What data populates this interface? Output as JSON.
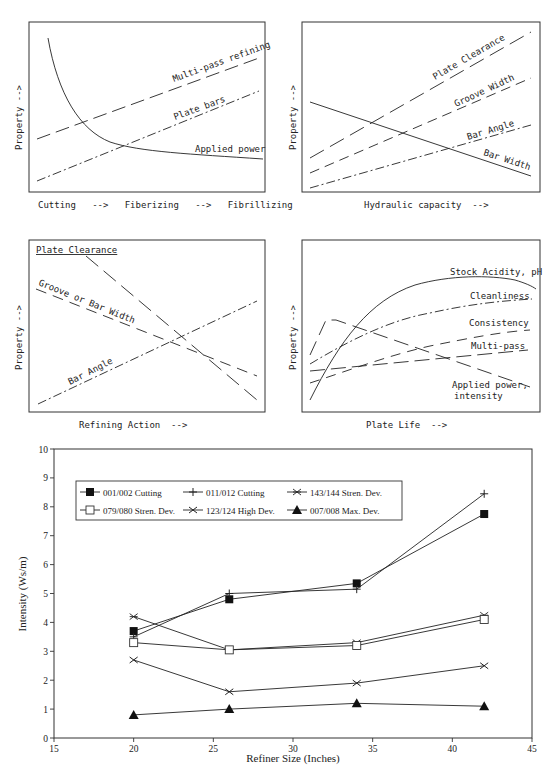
{
  "panels": [
    {
      "id": "tl",
      "ylabel": "Property  -->",
      "xlabel": "Cutting   -->   Fiberizing   -->   Fibrillizing",
      "curves": [
        {
          "label": "Multi-pass refining",
          "style": "long-dash"
        },
        {
          "label": "Plate bars",
          "style": "dash-dot"
        },
        {
          "label": "Applied power",
          "style": "solid"
        }
      ]
    },
    {
      "id": "tr",
      "ylabel": "Property  -->",
      "xlabel": "Hydraulic capacity  -->",
      "curves": [
        {
          "label": "Plate Clearance",
          "style": "long-dash"
        },
        {
          "label": "Groove Width",
          "style": "dash"
        },
        {
          "label": "Bar Angle",
          "style": "dash-dot"
        },
        {
          "label": "Bar Width",
          "style": "solid"
        }
      ]
    },
    {
      "id": "ml",
      "ylabel": "Property  -->",
      "xlabel": "Refining Action  -->",
      "curves": [
        {
          "label": "Plate Clearance",
          "style": "long-dash"
        },
        {
          "label": "Groove or Bar Width",
          "style": "dash"
        },
        {
          "label": "Bar Angle",
          "style": "dash-dot"
        }
      ]
    },
    {
      "id": "mr",
      "ylabel": "Property  -->",
      "xlabel": "Plate Life  -->",
      "curves": [
        {
          "label": "Stock Acidity, pH",
          "style": "solid"
        },
        {
          "label": "Cleanliness",
          "style": "dash-dot"
        },
        {
          "label": "Consistency",
          "style": "dash"
        },
        {
          "label": "Multi-pass",
          "style": "long-dash"
        },
        {
          "label": "Applied power,",
          "label2": "intensity",
          "style": "long-dash"
        }
      ]
    }
  ],
  "chart_data": [
    {
      "type": "line",
      "title": "Qualitative: Cutting to Fibrillizing",
      "xlabel": "Cutting --> Fiberizing --> Fibrillizing",
      "ylabel": "Property -->",
      "series": [
        {
          "name": "Multi-pass refining",
          "trend": "increasing linear"
        },
        {
          "name": "Plate bars",
          "trend": "increasing linear"
        },
        {
          "name": "Applied power",
          "trend": "steeply decreasing then flattening"
        }
      ]
    },
    {
      "type": "line",
      "title": "Qualitative: Hydraulic capacity",
      "xlabel": "Hydraulic capacity -->",
      "ylabel": "Property -->",
      "series": [
        {
          "name": "Plate Clearance",
          "trend": "increasing"
        },
        {
          "name": "Groove Width",
          "trend": "increasing"
        },
        {
          "name": "Bar Angle",
          "trend": "increasing"
        },
        {
          "name": "Bar Width",
          "trend": "decreasing"
        }
      ]
    },
    {
      "type": "line",
      "title": "Qualitative: Refining Action",
      "xlabel": "Refining Action -->",
      "ylabel": "Property -->",
      "series": [
        {
          "name": "Plate Clearance",
          "trend": "decreasing steeply"
        },
        {
          "name": "Groove or Bar Width",
          "trend": "decreasing"
        },
        {
          "name": "Bar Angle",
          "trend": "increasing"
        }
      ]
    },
    {
      "type": "line",
      "title": "Qualitative: Plate Life",
      "xlabel": "Plate Life -->",
      "ylabel": "Property -->",
      "series": [
        {
          "name": "Stock Acidity, pH",
          "trend": "rising then plateau, slight drop"
        },
        {
          "name": "Cleanliness",
          "trend": "rising, saturating"
        },
        {
          "name": "Consistency",
          "trend": "rising, saturating"
        },
        {
          "name": "Multi-pass",
          "trend": "slowly increasing"
        },
        {
          "name": "Applied power, intensity",
          "trend": "quick peak then decreasing"
        }
      ]
    },
    {
      "type": "line",
      "title": "",
      "xlabel": "Refiner Size (Inches)",
      "ylabel": "Intensity  (Ws/m)",
      "xlim": [
        15,
        45
      ],
      "ylim": [
        0,
        10
      ],
      "xticks": [
        15,
        20,
        25,
        30,
        35,
        40,
        45
      ],
      "yticks": [
        0,
        1,
        2,
        3,
        4,
        5,
        6,
        7,
        8,
        9,
        10
      ],
      "grid": false,
      "legend_position": "upper left (inside)",
      "x": [
        20,
        26,
        34,
        42
      ],
      "series": [
        {
          "name": "001/002  Cutting",
          "marker": "filled-square",
          "values": [
            3.7,
            4.8,
            5.35,
            7.75
          ]
        },
        {
          "name": "011/012  Cutting",
          "marker": "plus",
          "values": [
            3.5,
            5.0,
            5.15,
            8.45
          ]
        },
        {
          "name": "143/144 Stren. Dev.",
          "marker": "asterisk",
          "values": [
            4.2,
            3.05,
            3.3,
            4.25
          ]
        },
        {
          "name": "079/080 Stren. Dev.",
          "marker": "open-square",
          "values": [
            3.3,
            3.05,
            3.2,
            4.1
          ]
        },
        {
          "name": "123/124  High Dev.",
          "marker": "x",
          "values": [
            2.7,
            1.6,
            1.9,
            2.5
          ]
        },
        {
          "name": "007/008  Max. Dev.",
          "marker": "filled-triangle",
          "values": [
            0.8,
            1.0,
            1.2,
            1.1
          ]
        }
      ]
    }
  ]
}
